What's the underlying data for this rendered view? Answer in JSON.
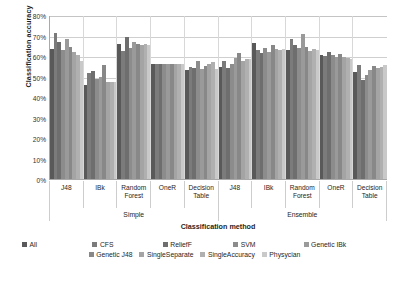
{
  "chart_data": {
    "type": "bar",
    "title": "",
    "xlabel": "Classification method",
    "ylabel": "Classification accuracy",
    "ylim": [
      0,
      80
    ],
    "ytick_labels": [
      "80%",
      "70%",
      "60%",
      "50%",
      "40%",
      "30%",
      "20%",
      "10%",
      "0%"
    ],
    "ytick_values": [
      80,
      70,
      60,
      50,
      40,
      30,
      20,
      10,
      0
    ],
    "grid": true,
    "legend_position": "bottom",
    "super_categories": [
      {
        "label": "Simple",
        "span": 5
      },
      {
        "label": "Ensemble",
        "span": 5
      }
    ],
    "categories": [
      "J48",
      "IBk",
      "Random Forest",
      "OneR",
      "Decision Table",
      "J48",
      "IBk",
      "Random Forest",
      "OneR",
      "Decision Table"
    ],
    "series": [
      {
        "name": "All",
        "color": "#595959",
        "values": [
          63.5,
          46.0,
          66.0,
          56.0,
          53.0,
          54.5,
          66.5,
          63.0,
          60.5,
          52.0
        ]
      },
      {
        "name": "CFS",
        "color": "#7b7b7b",
        "values": [
          71.0,
          51.5,
          62.5,
          56.0,
          54.5,
          57.5,
          63.0,
          68.5,
          60.0,
          55.5
        ]
      },
      {
        "name": "ReliefF",
        "color": "#6e6e6e",
        "values": [
          67.0,
          52.5,
          69.5,
          56.0,
          54.0,
          54.0,
          61.5,
          65.5,
          62.0,
          48.5
        ]
      },
      {
        "name": "SVM",
        "color": "#8c8c8c",
        "values": [
          63.0,
          49.0,
          64.0,
          56.0,
          57.5,
          56.0,
          64.0,
          64.0,
          60.5,
          50.5
        ]
      },
      {
        "name": "Genetic IBk",
        "color": "#9a9a9a",
        "values": [
          68.5,
          50.0,
          67.0,
          56.0,
          53.5,
          59.0,
          62.0,
          70.5,
          59.5,
          53.0
        ]
      },
      {
        "name": "Genetic J48",
        "color": "#888888",
        "values": [
          64.5,
          55.5,
          66.0,
          56.0,
          55.0,
          61.5,
          65.5,
          64.5,
          61.0,
          55.0
        ]
      },
      {
        "name": "SingleSeparate",
        "color": "#a4a4a4",
        "values": [
          62.0,
          47.5,
          65.5,
          56.0,
          56.0,
          57.5,
          63.5,
          62.5,
          59.5,
          54.0
        ]
      },
      {
        "name": "SingleAccuracy",
        "color": "#b0b0b0",
        "values": [
          60.5,
          47.5,
          66.0,
          56.0,
          57.0,
          58.5,
          63.0,
          63.5,
          59.0,
          54.5
        ]
      },
      {
        "name": "Physycian",
        "color": "#c9c9c9",
        "values": [
          57.5,
          47.5,
          65.5,
          56.0,
          53.5,
          58.5,
          63.5,
          63.0,
          58.5,
          55.5
        ]
      }
    ]
  },
  "axis": {
    "ylabel": "Classification accuracy",
    "xlabel": "Classification method"
  }
}
